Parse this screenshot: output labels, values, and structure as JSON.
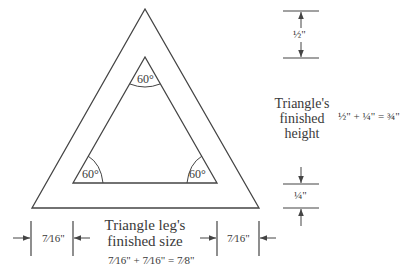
{
  "diagram": {
    "stroke_color": "#444444",
    "angles": [
      {
        "label": "60°",
        "position": "top"
      },
      {
        "label": "60°",
        "position": "bottom-left"
      },
      {
        "label": "60°",
        "position": "bottom-right"
      }
    ],
    "height_dimensions": {
      "top": {
        "label": "½\""
      },
      "bottom": {
        "label": "¼\""
      }
    },
    "height_label": {
      "line1": "Triangle's",
      "line2": "finished",
      "line3": "height"
    },
    "height_formula": "½\" + ¼\" = ¾\"",
    "leg_dimensions": {
      "left": {
        "label": "7⁄16\""
      },
      "right": {
        "label": "7⁄16\""
      }
    },
    "leg_label": {
      "line1": "Triangle leg's",
      "line2": "finished size"
    },
    "leg_formula": "7⁄16\" + 7⁄16\" = 7⁄8\""
  }
}
